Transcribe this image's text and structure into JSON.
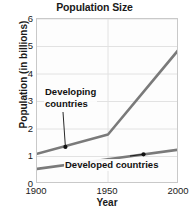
{
  "chart_data": {
    "type": "line",
    "title": "Population Size",
    "xlabel": "Year",
    "ylabel": "Population (in billions)",
    "xlim": [
      1900,
      2000
    ],
    "ylim": [
      0,
      6
    ],
    "xticks": [
      "1900",
      "1950",
      "2000"
    ],
    "xtick_values": [
      1900,
      1950,
      2000
    ],
    "yticks": [
      "0",
      "1",
      "2",
      "3",
      "4",
      "5",
      "6"
    ],
    "ytick_values": [
      0,
      1,
      2,
      3,
      4,
      5,
      6
    ],
    "grid": true,
    "legend": "annotations-inline",
    "line_color": "#7a7a7a",
    "series": [
      {
        "name": "Developing countries",
        "color": "#7a7a7a",
        "x": [
          1900,
          1950,
          2000
        ],
        "values": [
          1.1,
          1.8,
          4.9
        ],
        "marker_point": {
          "x": 1920,
          "y": 1.35
        }
      },
      {
        "name": "Developed countries",
        "color": "#7a7a7a",
        "x": [
          1900,
          1950,
          2000
        ],
        "values": [
          0.55,
          0.9,
          1.25
        ],
        "marker_point": {
          "x": 1975,
          "y": 1.08
        }
      }
    ],
    "annotations": [
      {
        "text_line1": "Developing",
        "text_line2": "countries",
        "points_to": {
          "x": 1920,
          "y": 1.35
        }
      },
      {
        "text_line1": "Developed countries",
        "text_line2": "",
        "points_to": {
          "x": 1975,
          "y": 1.08
        }
      }
    ]
  },
  "chart": {
    "title": "Population Size",
    "xlabel": "Year",
    "ylabel": "Population (in billions)",
    "annot_developing_l1": "Developing",
    "annot_developing_l2": "countries",
    "annot_developed": "Developed countries"
  }
}
